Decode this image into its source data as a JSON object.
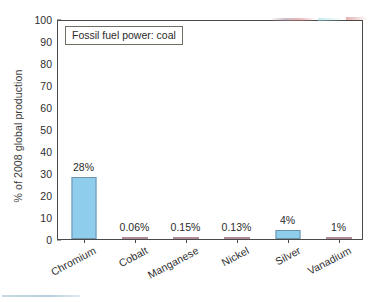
{
  "chart_data": {
    "type": "bar",
    "title": "",
    "subtitle": "",
    "legend_label": "Fossil fuel power: coal",
    "legend_position": "inside-top-left",
    "categories": [
      "Chromium",
      "Cobalt",
      "Manganese",
      "Nickel",
      "Silver",
      "Vanadium"
    ],
    "values": [
      28,
      0.06,
      0.15,
      0.13,
      4,
      1
    ],
    "value_labels": [
      "28%",
      "0.06%",
      "0.15%",
      "0.13%",
      "4%",
      "1%"
    ],
    "xlabel": "",
    "ylabel": "% of 2008 global production",
    "ylim": [
      0,
      100
    ],
    "ytick_labels": [
      "0",
      "10",
      "20",
      "30",
      "40",
      "50",
      "60",
      "70",
      "80",
      "90",
      "100"
    ],
    "ytick_values": [
      0,
      10,
      20,
      30,
      40,
      50,
      60,
      70,
      80,
      90,
      100
    ],
    "grid": false,
    "bar_color": "#8ecdec",
    "bar_edge_color": "#6f93ad",
    "small_bar_color": "#c9a2b0",
    "axis_color": "#4a4a4a",
    "text_color": "#2e2e2e",
    "background_color": "#ffffff"
  }
}
